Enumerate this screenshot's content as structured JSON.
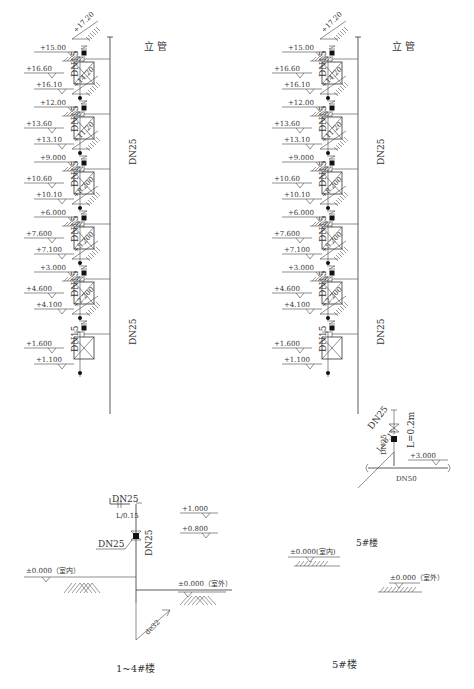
{
  "left": {
    "title": "1~4#楼",
    "riser_label": "立  管",
    "riser_dn": "DN25",
    "branch_dn": "DN15",
    "floors": [
      {
        "slab": "+15.00",
        "upper": "+16.60",
        "lower": "+16.10",
        "valve": "+17.20"
      },
      {
        "slab": "+12.00",
        "upper": "+13.60",
        "lower": "+13.10",
        "valve": "+14.20"
      },
      {
        "slab": "+9.000",
        "upper": "+10.60",
        "lower": "+10.10",
        "valve": "+11.20"
      },
      {
        "slab": "+6.000",
        "upper": "+7.600",
        "lower": "+7.100",
        "valve": "+8.200"
      },
      {
        "slab": "+3.000",
        "upper": "+4.600",
        "lower": "+4.100",
        "valve": "+5.200"
      },
      {
        "slab": "",
        "upper": "+1.600",
        "lower": "+1.100",
        "valve": "+2.200"
      }
    ],
    "base": {
      "dn_top": "DN25",
      "l_label": "L/0.15",
      "valve_dn": "DN25",
      "riser_dn_vertical": "DN25",
      "elev_1": "+1.000",
      "elev_2": "+0.800",
      "indoor": "±0.000（室内）",
      "outdoor": "±0.000（室外）",
      "inlet": "de32"
    }
  },
  "right": {
    "title": "5#楼",
    "sub_title": "5#楼",
    "riser_label": "立  管",
    "riser_dn": "DN25",
    "branch_dn": "DN15",
    "floors": [
      {
        "slab": "+15.00",
        "upper": "+16.60",
        "lower": "+16.10",
        "valve": "+17.20"
      },
      {
        "slab": "+12.00",
        "upper": "+13.60",
        "lower": "+13.10",
        "valve": "+14.20"
      },
      {
        "slab": "+9.000",
        "upper": "+10.60",
        "lower": "+10.10",
        "valve": "+11.20"
      },
      {
        "slab": "+6.000",
        "upper": "+7.600",
        "lower": "+7.100",
        "valve": "+8.200"
      },
      {
        "slab": "+3.000",
        "upper": "+4.600",
        "lower": "+4.100",
        "valve": "+5.200"
      },
      {
        "slab": "",
        "upper": "+1.600",
        "lower": "+1.100",
        "valve": "+2.200"
      }
    ],
    "base": {
      "diag_dn": "DN25",
      "diag_l": "L=0.15",
      "valve_dn": "DN25",
      "l_vertical": "L=0.2m",
      "main_dn": "DN50",
      "elev_main": "+3.000",
      "indoor": "±0.000(室内)",
      "outdoor": "±0.000（室外）"
    }
  }
}
